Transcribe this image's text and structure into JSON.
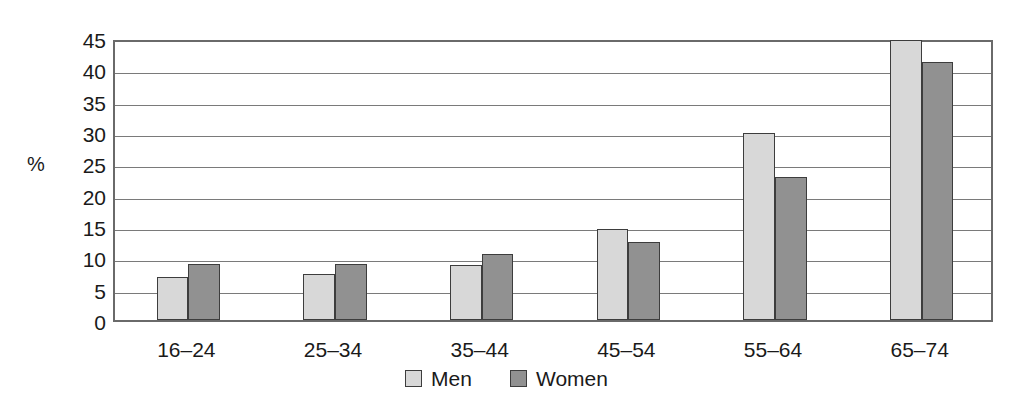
{
  "chart_data": {
    "type": "bar",
    "title": "",
    "subtitle": "",
    "xlabel": "",
    "ylabel": "%",
    "ylim": [
      0,
      45
    ],
    "ytick_step": 5,
    "yticks": [
      0,
      5,
      10,
      15,
      20,
      25,
      30,
      35,
      40,
      45
    ],
    "ytick_labels": [
      "0",
      "5",
      "10",
      "15",
      "20",
      "25",
      "30",
      "35",
      "40",
      "45"
    ],
    "grid": true,
    "grid_axis": "y",
    "legend_position": "bottom-center",
    "categories": [
      "16–24",
      "25–34",
      "35–44",
      "45–54",
      "55–64",
      "65–74"
    ],
    "series": [
      {
        "name": "Men",
        "color": "#d8d8d8",
        "values": [
          6.8,
          7.3,
          8.8,
          14.5,
          29.8,
          44.7
        ]
      },
      {
        "name": "Women",
        "color": "#919191",
        "values": [
          9.0,
          9.0,
          10.5,
          12.5,
          22.8,
          41.2
        ]
      }
    ]
  },
  "legend": {
    "entries": [
      {
        "label": "Men",
        "swatch": "light-gray-swatch-icon"
      },
      {
        "label": "Women",
        "swatch": "dark-gray-swatch-icon"
      }
    ]
  },
  "colors": {
    "men_fill": "#d8d8d8",
    "women_fill": "#919191",
    "bar_outline": "#3d3d3d",
    "gridline": "#7a7a7a",
    "axis_border": "#6a6a6a",
    "text": "#1a1a1a",
    "background": "#ffffff"
  }
}
